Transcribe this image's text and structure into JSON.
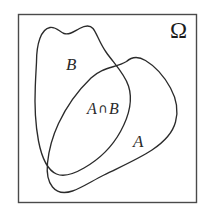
{
  "figure": {
    "kind": "venn-diagram",
    "universe_label": "Ω",
    "set_a_label": "A",
    "set_b_label": "B",
    "intersection_label_left": "A",
    "intersection_operator": "∩",
    "intersection_label_right": "B",
    "colors": {
      "background": "#ffffff",
      "stroke": "#2b2b2b",
      "frame_stroke": "#4a4a4a",
      "text": "#2b2b2b"
    },
    "frame": {
      "x": 18,
      "y": 14,
      "width": 179,
      "height": 189,
      "stroke_width": 1.4
    },
    "curves": {
      "set_b_stroke_width": 1.3,
      "set_a_stroke_width": 1.3
    }
  }
}
